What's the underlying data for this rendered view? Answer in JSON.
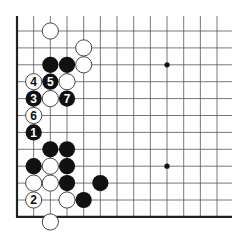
{
  "diagram": {
    "type": "go-board-fragment",
    "grid": {
      "columns": 13,
      "rows": 12,
      "origin_x": 17,
      "origin_y": 31,
      "spacing_x": 16.67,
      "spacing_y": 16.9,
      "right_end_x": 232,
      "top_start_y": 16,
      "bottom_edge": true,
      "left_edge": true
    },
    "colors": {
      "line": "#555555",
      "edge": "#222222",
      "black_stone": "#111111",
      "white_stone": "#ffffff",
      "stone_outline": "#333333",
      "star": "#111111"
    },
    "star_points": [
      {
        "c": 9,
        "r": 2
      },
      {
        "c": 9,
        "r": 8
      }
    ],
    "stones": [
      {
        "color": "white",
        "c": 2,
        "r": 0,
        "label": ""
      },
      {
        "color": "white",
        "c": 4,
        "r": 1,
        "label": ""
      },
      {
        "color": "black",
        "c": 2,
        "r": 2,
        "label": ""
      },
      {
        "color": "black",
        "c": 3,
        "r": 2,
        "label": ""
      },
      {
        "color": "white",
        "c": 4,
        "r": 2,
        "label": ""
      },
      {
        "color": "white",
        "c": 1,
        "r": 3,
        "label": "4"
      },
      {
        "color": "black",
        "c": 2,
        "r": 3,
        "label": "5"
      },
      {
        "color": "white",
        "c": 3,
        "r": 3,
        "label": ""
      },
      {
        "color": "black",
        "c": 1,
        "r": 4,
        "label": "3"
      },
      {
        "color": "white",
        "c": 2,
        "r": 4,
        "label": ""
      },
      {
        "color": "black",
        "c": 3,
        "r": 4,
        "label": "7"
      },
      {
        "color": "white",
        "c": 1,
        "r": 5,
        "label": "6"
      },
      {
        "color": "black",
        "c": 1,
        "r": 6,
        "label": "1"
      },
      {
        "color": "black",
        "c": 2,
        "r": 7,
        "label": ""
      },
      {
        "color": "black",
        "c": 3,
        "r": 7,
        "label": ""
      },
      {
        "color": "black",
        "c": 1,
        "r": 8,
        "label": ""
      },
      {
        "color": "white",
        "c": 2,
        "r": 8,
        "label": ""
      },
      {
        "color": "black",
        "c": 3,
        "r": 8,
        "label": ""
      },
      {
        "color": "white",
        "c": 1,
        "r": 9,
        "label": ""
      },
      {
        "color": "white",
        "c": 2,
        "r": 9,
        "label": ""
      },
      {
        "color": "black",
        "c": 3,
        "r": 9,
        "label": ""
      },
      {
        "color": "black",
        "c": 5,
        "r": 9,
        "label": ""
      },
      {
        "color": "white",
        "c": 1,
        "r": 10,
        "label": "2"
      },
      {
        "color": "white",
        "c": 3,
        "r": 10,
        "label": ""
      },
      {
        "color": "black",
        "c": 4,
        "r": 10,
        "label": ""
      },
      {
        "color": "white",
        "c": 2,
        "r": 11.3,
        "label": ""
      }
    ]
  }
}
